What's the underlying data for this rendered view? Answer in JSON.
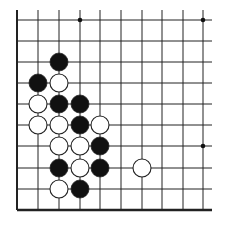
{
  "board": {
    "description": "Go board corner diagram (lower-left corner)",
    "columns_x": [
      17,
      38,
      59,
      80,
      100,
      121,
      142,
      162,
      183,
      203
    ],
    "rows_y": [
      20,
      41,
      62,
      83,
      104,
      125,
      146,
      168,
      189,
      210
    ],
    "line_top": 10,
    "line_right": 212,
    "star_points": [
      [
        3,
        0
      ],
      [
        9,
        0
      ],
      [
        9,
        6
      ]
    ],
    "stone_radius": 9,
    "colors": {
      "line": "#222222",
      "black": "#111111",
      "white": "#ffffff",
      "stroke": "#222222"
    },
    "stones": [
      {
        "color": "black",
        "col": 2,
        "row": 2
      },
      {
        "color": "black",
        "col": 1,
        "row": 3
      },
      {
        "color": "white",
        "col": 2,
        "row": 3
      },
      {
        "color": "white",
        "col": 1,
        "row": 4
      },
      {
        "color": "black",
        "col": 2,
        "row": 4
      },
      {
        "color": "black",
        "col": 3,
        "row": 4
      },
      {
        "color": "white",
        "col": 1,
        "row": 5
      },
      {
        "color": "white",
        "col": 2,
        "row": 5
      },
      {
        "color": "black",
        "col": 3,
        "row": 5
      },
      {
        "color": "white",
        "col": 4,
        "row": 5
      },
      {
        "color": "white",
        "col": 2,
        "row": 6
      },
      {
        "color": "white",
        "col": 3,
        "row": 6
      },
      {
        "color": "black",
        "col": 4,
        "row": 6
      },
      {
        "color": "black",
        "col": 2,
        "row": 7
      },
      {
        "color": "white",
        "col": 3,
        "row": 7
      },
      {
        "color": "black",
        "col": 4,
        "row": 7
      },
      {
        "color": "white",
        "col": 6,
        "row": 7
      },
      {
        "color": "white",
        "col": 2,
        "row": 8
      },
      {
        "color": "black",
        "col": 3,
        "row": 8
      }
    ]
  }
}
